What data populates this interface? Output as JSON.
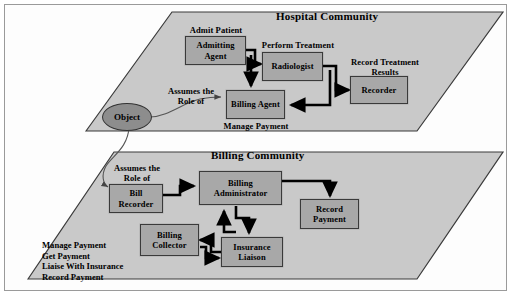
{
  "diagram": {
    "colors": {
      "plane_fill": "#c9c9c9",
      "plane_stroke": "#3a3a3a",
      "node_fill": "#a8a8a8",
      "node_stroke": "#3a3a3a",
      "object_fill": "#8d8d8d",
      "arrow": "#000000",
      "thin_arrow": "#555555",
      "page_background": "#ffffff"
    },
    "planes": [
      {
        "id": "hospital",
        "title": "Hospital Community"
      },
      {
        "id": "billing",
        "title": "Billing Community"
      }
    ],
    "hospital": {
      "title": "Hospital Community",
      "nodes": [
        {
          "id": "admitting-agent",
          "label": "Admitting\nAgent"
        },
        {
          "id": "radiologist",
          "label": "Radiologist"
        },
        {
          "id": "recorder",
          "label": "Recorder"
        },
        {
          "id": "billing-agent",
          "label": "Billing\nAgent"
        }
      ],
      "labels": [
        {
          "id": "admit-patient",
          "text": "Admit Patient"
        },
        {
          "id": "perform-treatment",
          "text": "Perform Treatment"
        },
        {
          "id": "record-treatment-results",
          "text": "Record Treatment\nResults"
        },
        {
          "id": "manage-payment",
          "text": "Manage Payment"
        },
        {
          "id": "assumes-role-of-upper",
          "text": "Assumes the\nRole of"
        }
      ]
    },
    "billing": {
      "title": "Billing Community",
      "nodes": [
        {
          "id": "bill-recorder",
          "label": "Bill\nRecorder"
        },
        {
          "id": "billing-administrator",
          "label": "Billing\nAdministrator"
        },
        {
          "id": "record-payment-box",
          "label": "Record\nPayment"
        },
        {
          "id": "billing-collector",
          "label": "Billing\nCollector"
        },
        {
          "id": "insurance-liaison",
          "label": "Insurance\nLiaison"
        }
      ],
      "labels": [
        {
          "id": "assumes-role-of-lower",
          "text": "Assumes the\nRole of"
        }
      ],
      "operations": "Manage Payment\nGet Payment\nLiaise With Insurance\nRecord Payment"
    },
    "object": {
      "id": "object-node",
      "label": "Object"
    }
  }
}
